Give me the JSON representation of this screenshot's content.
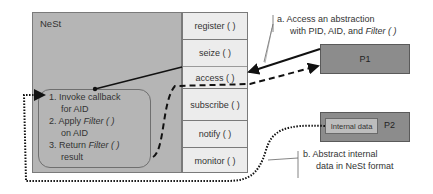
{
  "nest": {
    "title": "NeSt",
    "methods": [
      {
        "label": "register ( )"
      },
      {
        "label": "seize ( )"
      },
      {
        "label": "access ( )"
      },
      {
        "label": "subscribe ( )"
      },
      {
        "label": "notify ( )"
      },
      {
        "label": "monitor ( )"
      }
    ],
    "steps": {
      "s1_line1": "1. Invoke callback",
      "s1_line2": "for AID",
      "s2_prefix": "2. Apply ",
      "s2_italic": "Filter ( )",
      "s2_line2": "on AID",
      "s3_prefix": "3. Return ",
      "s3_italic": "Filter ( )",
      "s3_line2": "result"
    }
  },
  "processes": {
    "p1": {
      "label": "P1"
    },
    "p2": {
      "label": "P2",
      "internal_data": "Internal data"
    }
  },
  "callouts": {
    "a": {
      "line1": "a. Access an abstraction",
      "line2_prefix": "with PID, AID, and ",
      "line2_italic": "Filter ( )"
    },
    "b": {
      "line1": "b. Abstract internal",
      "line2": "data in NeSt format"
    }
  },
  "colors": {
    "nest_bg": "#b5b5b5",
    "methods_bg": "#ececec",
    "process_bg": "#8c8c8c",
    "internal_bg": "#bdbdbd"
  }
}
